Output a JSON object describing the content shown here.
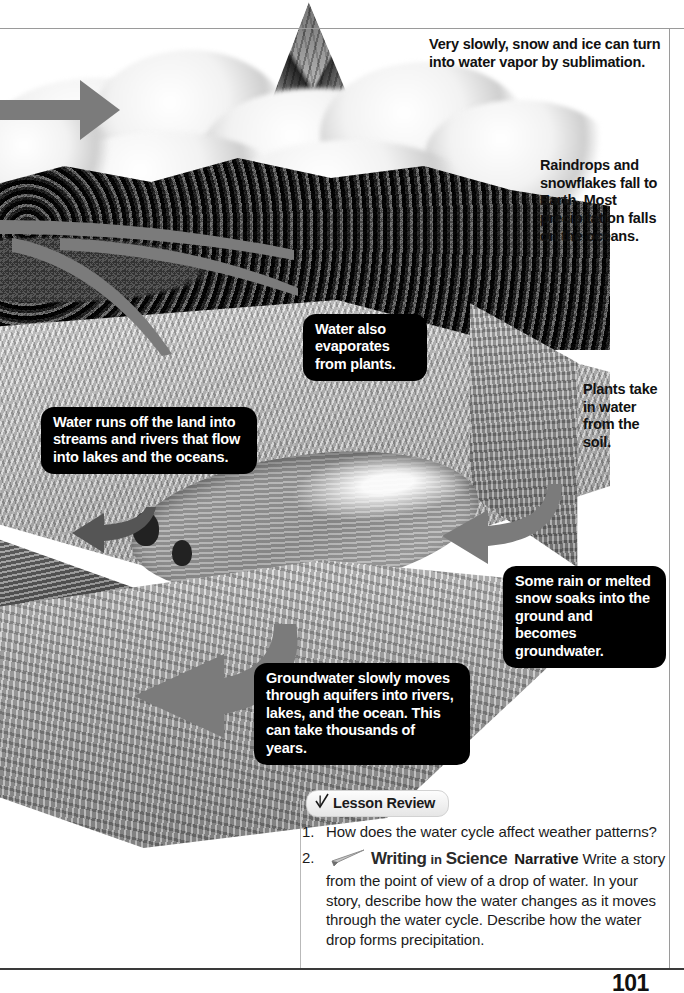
{
  "page": {
    "number": "101",
    "figure_alt": "Water cycle cross-section diagram"
  },
  "margin_labels": [
    {
      "id": "sublimation",
      "text": "Very slowly, snow and ice can turn into water vapor by sublimation."
    },
    {
      "id": "precipitation",
      "text": "Raindrops and snowflakes fall to Earth. Most precipitation falls on the oceans."
    },
    {
      "id": "plants-uptake",
      "text": "Plants take in water from the soil."
    }
  ],
  "callouts": [
    {
      "id": "transpiration",
      "text": "Water also evaporates from plants."
    },
    {
      "id": "runoff",
      "text": "Water runs off the land into streams and rivers that flow into lakes and the oceans."
    },
    {
      "id": "infiltration",
      "text": "Some rain or melted snow soaks into the ground and becomes groundwater."
    },
    {
      "id": "groundwater-flow",
      "text": "Groundwater slowly moves through aquifers into rivers, lakes, and the ocean. This can take thousands of years."
    }
  ],
  "lesson_review": {
    "heading": "Lesson Review",
    "check_icon": "checkmark-icon",
    "questions": [
      {
        "number": "1.",
        "text": "How does the water cycle affect weather patterns?"
      },
      {
        "number": "2.",
        "icon": "pencil-icon",
        "brand_writing": "Writing",
        "brand_in": "in",
        "brand_science": "Science",
        "genre": "Narrative",
        "text": "Write a story from the point of view of a drop of water. In your story, describe how the water changes as it moves through the water cycle. Describe how the water drop forms precipitation."
      }
    ]
  },
  "colors": {
    "callout_bg": "#000000",
    "callout_text": "#ffffff",
    "arrow": "#7b7b7b",
    "rule": "#9a9a9a",
    "text": "#111111"
  }
}
